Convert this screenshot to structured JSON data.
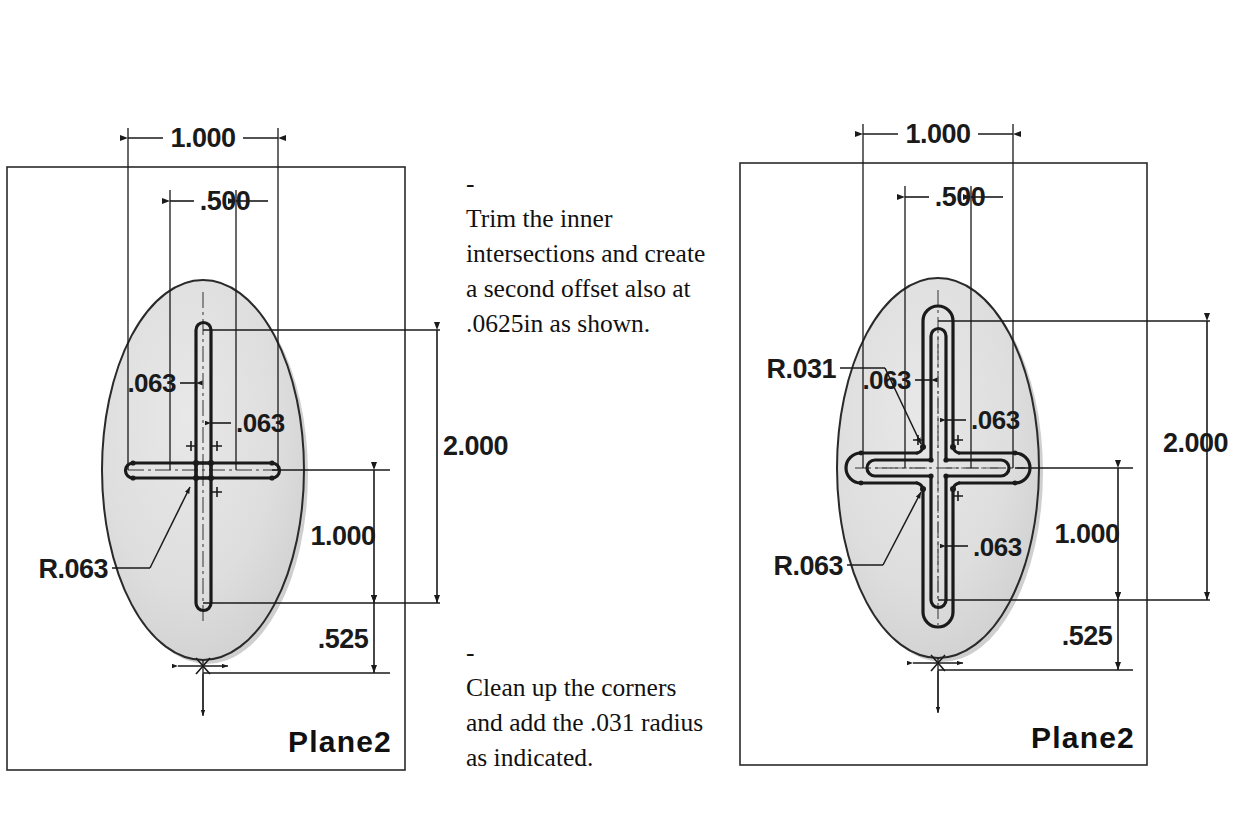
{
  "document": {
    "type": "cad-sketch-instruction-figure",
    "background_color": "#ffffff",
    "line_color": "#1a1a1a",
    "ellipse_fill": "#dcdcdc",
    "ellipse_shadow": "#9a9a9a"
  },
  "notes": [
    {
      "id": "note-trim",
      "bullet": "-",
      "text": "Trim the inner intersections and create a second offset also at .0625in as shown."
    },
    {
      "id": "note-cleanup",
      "bullet": "-",
      "text": "Clean up the corners and add the .031 radius as indicated."
    }
  ],
  "views": [
    {
      "id": "left-view",
      "name": "sketch-before-fillet",
      "plane_label": "Plane2",
      "dimensions": {
        "width_outer": "1.000",
        "width_inner": ".500",
        "height_overall": "2.000",
        "height_mid": "1.000",
        "height_bottom": ".525",
        "slot_width_left": ".063",
        "slot_width_right": ".063"
      },
      "callouts": [
        {
          "id": "radius-063",
          "label": "R.063"
        }
      ]
    },
    {
      "id": "right-view",
      "name": "sketch-after-offset-and-fillet",
      "plane_label": "Plane2",
      "dimensions": {
        "width_outer": "1.000",
        "width_inner": ".500",
        "height_overall": "2.000",
        "height_mid": "1.000",
        "height_bottom": ".525",
        "slot_width_left": ".063",
        "slot_width_right": ".063",
        "slot_width_lower": ".063"
      },
      "callouts": [
        {
          "id": "radius-031",
          "label": "R.031"
        },
        {
          "id": "radius-063",
          "label": "R.063"
        }
      ]
    }
  ]
}
